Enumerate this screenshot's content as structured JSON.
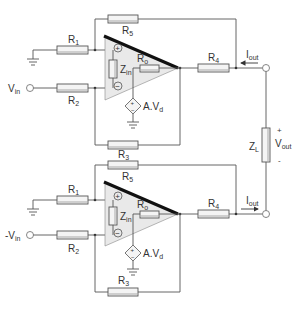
{
  "diagram": {
    "type": "circuit-schematic",
    "stages": [
      {
        "id": "top",
        "input_label": "V",
        "input_sub": "in",
        "input_prefix": "",
        "current_direction": "in",
        "labels": {
          "R1": {
            "main": "R",
            "sub": "1"
          },
          "R2": {
            "main": "R",
            "sub": "2"
          },
          "R3": {
            "main": "R",
            "sub": "3"
          },
          "R4": {
            "main": "R",
            "sub": "4"
          },
          "R5": {
            "main": "R",
            "sub": "5"
          },
          "Ro": {
            "main": "R",
            "sub": "o"
          },
          "Zin": {
            "main": "Z",
            "sub": "in"
          },
          "source": {
            "main": "A.V",
            "sub": "d"
          },
          "Iout": {
            "main": "I",
            "sub": "out"
          },
          "plus": "+",
          "minus": "−"
        }
      },
      {
        "id": "bottom",
        "input_label": "V",
        "input_sub": "in",
        "input_prefix": "-",
        "current_direction": "out",
        "labels": {
          "R1": {
            "main": "R",
            "sub": "1"
          },
          "R2": {
            "main": "R",
            "sub": "2"
          },
          "R3": {
            "main": "R",
            "sub": "3"
          },
          "R4": {
            "main": "R",
            "sub": "4"
          },
          "R5": {
            "main": "R",
            "sub": "5"
          },
          "Ro": {
            "main": "R",
            "sub": "o"
          },
          "Zin": {
            "main": "Z",
            "sub": "in"
          },
          "source": {
            "main": "A.V",
            "sub": "d"
          },
          "Iout": {
            "main": "I",
            "sub": "out"
          },
          "plus": "+",
          "minus": "−"
        }
      }
    ],
    "load": {
      "label": {
        "main": "Z",
        "sub": "L"
      },
      "vout": {
        "main": "V",
        "sub": "out"
      },
      "plus": "+",
      "minus": "-"
    }
  },
  "colors": {
    "wire": "#555555",
    "opamp_fill": "#e9e9e9",
    "opamp_edge": "#111111",
    "resistor_fill": "#f4f4f4"
  }
}
